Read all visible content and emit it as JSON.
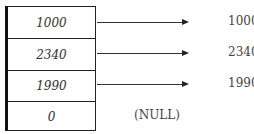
{
  "diagram": {
    "cells": [
      {
        "value": "1000",
        "points_to": "1000"
      },
      {
        "value": "2340",
        "points_to": "2340"
      },
      {
        "value": "1990",
        "points_to": "1990"
      },
      {
        "value": "0",
        "points_to": "(NULL)"
      }
    ]
  }
}
